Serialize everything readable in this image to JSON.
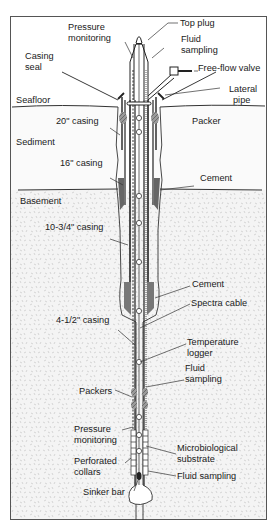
{
  "diagram": {
    "type": "borehole-observatory-cross-section",
    "layers": {
      "seafloor": "Seafloor",
      "sediment": "Sediment",
      "basement": "Basement"
    },
    "labels": {
      "top_plug": "Top plug",
      "pressure_monitoring_top_1": "Pressure",
      "pressure_monitoring_top_2": "monitoring",
      "fluid_sampling_top_1": "Fluid",
      "fluid_sampling_top_2": "sampling",
      "casing_seal_1": "Casing",
      "casing_seal_2": "seal",
      "free_flow_valve": "Free-flow valve",
      "lateral_pipe_1": "Lateral",
      "lateral_pipe_2": "pipe",
      "casing_20": "20\" casing",
      "packer": "Packer",
      "casing_16": "16\" casing",
      "cement_upper": "Cement",
      "casing_10_3_4": "10-3/4\" casing",
      "cement_lower": "Cement",
      "spectra_cable": "Spectra cable",
      "casing_4_1_2": "4-1/2\" casing",
      "temperature_logger_1": "Temperature",
      "temperature_logger_2": "logger",
      "fluid_sampling_mid_1": "Fluid",
      "fluid_sampling_mid_2": "sampling",
      "packers": "Packers",
      "pressure_monitoring_bottom_1": "Pressure",
      "pressure_monitoring_bottom_2": "monitoring",
      "microbiological_substrate_1": "Microbiological",
      "microbiological_substrate_2": "substrate",
      "perforated_collars_1": "Perforated",
      "perforated_collars_2": "collars",
      "fluid_sampling_bottom": "Fluid sampling",
      "sinker_bar": "Sinker bar"
    },
    "colors": {
      "line": "#2a2a2a",
      "cement": "#6e6e6e",
      "packer": "#8a8a8a",
      "sediment_fill": "#f7f7f7",
      "basement_fill": "#f0f0f0",
      "frame": "#555555"
    }
  }
}
